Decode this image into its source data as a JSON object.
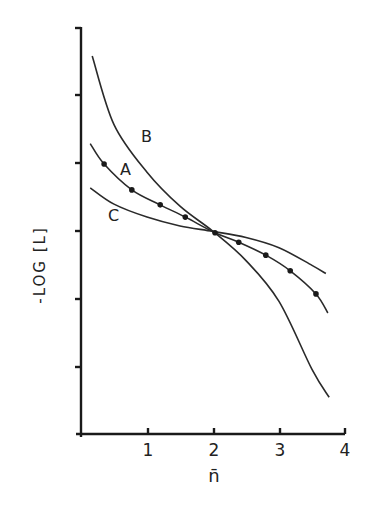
{
  "chart_data": {
    "type": "line",
    "title": "",
    "xlabel": "n̄",
    "ylabel": "-LOG [L]",
    "xlim": [
      0,
      4
    ],
    "ylim": [
      0,
      6
    ],
    "x_ticks": [
      "1",
      "2",
      "3",
      "4"
    ],
    "y_ticks_labeled": false,
    "y_tick_count": 6,
    "grid": false,
    "legend": "inline curve labels",
    "series": [
      {
        "name": "A",
        "markers": true,
        "x": [
          0.14,
          0.35,
          0.77,
          1.2,
          1.58,
          2.03,
          2.39,
          2.8,
          3.17,
          3.56,
          3.74
        ],
        "y": [
          4.27,
          3.97,
          3.59,
          3.37,
          3.19,
          2.96,
          2.82,
          2.63,
          2.4,
          2.06,
          1.78
        ],
        "points_x": [
          0.35,
          0.77,
          1.2,
          1.58,
          2.03,
          2.39,
          2.8,
          3.17,
          3.56
        ],
        "points_y": [
          3.97,
          3.59,
          3.37,
          3.19,
          2.96,
          2.82,
          2.63,
          2.4,
          2.06
        ]
      },
      {
        "name": "B",
        "markers": false,
        "x": [
          0.17,
          0.5,
          1.0,
          1.5,
          2.0,
          2.5,
          3.0,
          3.5,
          3.76
        ],
        "y": [
          5.56,
          4.55,
          3.85,
          3.35,
          2.98,
          2.55,
          1.95,
          0.95,
          0.54
        ]
      },
      {
        "name": "C",
        "markers": false,
        "x": [
          0.14,
          0.5,
          1.0,
          1.5,
          2.0,
          2.5,
          3.0,
          3.5,
          3.71
        ],
        "y": [
          3.62,
          3.38,
          3.19,
          3.06,
          2.98,
          2.89,
          2.74,
          2.48,
          2.36
        ]
      }
    ]
  },
  "axes": {
    "ylabel": "-LOG [L]",
    "xlabel": "n̄",
    "xtick_labels": [
      "1",
      "2",
      "3",
      "4"
    ]
  },
  "labels": {
    "A": "A",
    "B": "B",
    "C": "C"
  }
}
